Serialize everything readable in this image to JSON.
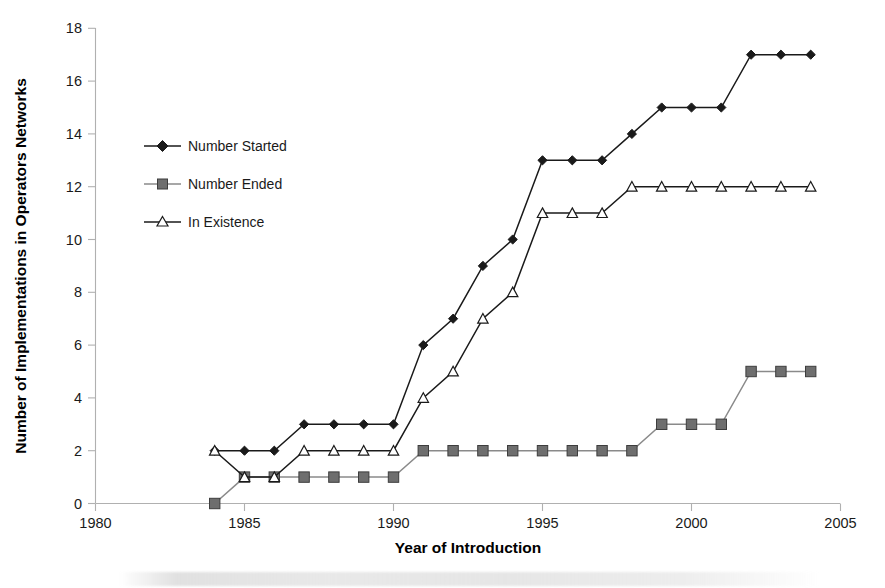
{
  "chart_data": {
    "type": "line",
    "title": "",
    "xlabel": "Year of Introduction",
    "ylabel": "Number of Implementations in Operators Networks",
    "xlim": [
      1980,
      2005
    ],
    "ylim": [
      0,
      18
    ],
    "xticks": [
      1980,
      1985,
      1990,
      1995,
      2000,
      2005
    ],
    "yticks": [
      0,
      2,
      4,
      6,
      8,
      10,
      12,
      14,
      16,
      18
    ],
    "grid": false,
    "legend_position": "upper-left-inside",
    "x": [
      1984,
      1985,
      1986,
      1987,
      1988,
      1989,
      1990,
      1991,
      1992,
      1993,
      1994,
      1995,
      1996,
      1997,
      1998,
      1999,
      2000,
      2001,
      2002,
      2003,
      2004
    ],
    "series": [
      {
        "name": "Number Started",
        "marker": "diamond",
        "color": "#1a1a1a",
        "values": [
          2,
          2,
          2,
          3,
          3,
          3,
          3,
          6,
          7,
          9,
          10,
          13,
          13,
          13,
          14,
          15,
          15,
          15,
          17,
          17,
          17
        ]
      },
      {
        "name": "Number Ended",
        "marker": "square",
        "color": "#6e6e6e",
        "values": [
          0,
          1,
          1,
          1,
          1,
          1,
          1,
          2,
          2,
          2,
          2,
          2,
          2,
          2,
          2,
          3,
          3,
          3,
          5,
          5,
          5
        ]
      },
      {
        "name": "In Existence",
        "marker": "triangle",
        "color": "#ffffff",
        "values": [
          2,
          1,
          1,
          2,
          2,
          2,
          2,
          4,
          5,
          7,
          8,
          11,
          11,
          11,
          12,
          12,
          12,
          12,
          12,
          12,
          12
        ]
      }
    ]
  },
  "axes": {
    "x_title": "Year of Introduction",
    "y_title": "Number of Implementations in Operators Networks",
    "x_tick_labels": [
      "1980",
      "1985",
      "1990",
      "1995",
      "2000",
      "2005"
    ],
    "y_tick_labels": [
      "0",
      "2",
      "4",
      "6",
      "8",
      "10",
      "12",
      "14",
      "16",
      "18"
    ]
  },
  "legend": {
    "items": [
      {
        "label": "Number Started",
        "marker": "diamond-icon"
      },
      {
        "label": "Number Ended",
        "marker": "square-icon"
      },
      {
        "label": "In Existence",
        "marker": "triangle-icon"
      }
    ]
  },
  "colors": {
    "series_started": "#1a1a1a",
    "series_ended": "#6e6e6e",
    "series_existence": "#1a1a1a",
    "axis": "#b0b0b0",
    "text": "#1a1a1a",
    "background": "#ffffff"
  }
}
